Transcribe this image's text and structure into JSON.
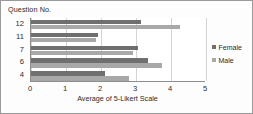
{
  "chart_data": {
    "type": "bar",
    "orientation": "horizontal",
    "title": "",
    "xlabel": "Average of 5-Likert Scale",
    "ylabel": "Question No.",
    "categories": [
      "12",
      "11",
      "7",
      "6",
      "4"
    ],
    "series": [
      {
        "name": "Female",
        "color": "#6f6f6f",
        "values": [
          3.15,
          1.9,
          3.05,
          3.35,
          2.1
        ]
      },
      {
        "name": "Male",
        "color": "#a8a8a8",
        "values": [
          4.25,
          1.85,
          2.9,
          3.75,
          2.8
        ]
      }
    ],
    "xlim": [
      0,
      5
    ],
    "xticks": [
      "0",
      "1",
      "2",
      "3",
      "4",
      "5"
    ],
    "grid": "vertical",
    "legend_position": "right"
  },
  "legend": {
    "entries": [
      {
        "label": "Female",
        "color": "#6f6f6f"
      },
      {
        "label": "Male",
        "color": "#a8a8a8"
      }
    ]
  }
}
